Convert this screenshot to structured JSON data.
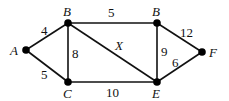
{
  "graph": {
    "nodes": {
      "A": {
        "label": "A",
        "x": 26,
        "y": 50
      },
      "B1": {
        "label": "B",
        "x": 68,
        "y": 23
      },
      "C": {
        "label": "C",
        "x": 68,
        "y": 82
      },
      "B2": {
        "label": "B",
        "x": 157,
        "y": 23
      },
      "E": {
        "label": "E",
        "x": 157,
        "y": 82
      },
      "F": {
        "label": "F",
        "x": 202,
        "y": 52
      }
    },
    "edges": [
      {
        "from": "A",
        "to": "B1",
        "weight": "4"
      },
      {
        "from": "A",
        "to": "C",
        "weight": "5"
      },
      {
        "from": "B1",
        "to": "C",
        "weight": "8"
      },
      {
        "from": "B1",
        "to": "B2",
        "weight": "5"
      },
      {
        "from": "B1",
        "to": "E",
        "weight": "X"
      },
      {
        "from": "C",
        "to": "E",
        "weight": "10"
      },
      {
        "from": "B2",
        "to": "E",
        "weight": "9"
      },
      {
        "from": "B2",
        "to": "F",
        "weight": "12"
      },
      {
        "from": "E",
        "to": "F",
        "weight": "6"
      }
    ]
  }
}
